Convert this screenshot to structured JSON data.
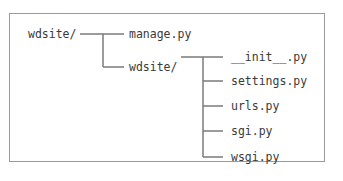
{
  "diagram": {
    "type": "directory-tree",
    "root": "wdsite/",
    "level1": [
      "manage.py",
      "wdsite/"
    ],
    "level2": [
      "__init__.py",
      "settings.py",
      "urls.py",
      "sgi.py",
      "wsgi.py"
    ]
  },
  "colors": {
    "line": "#7a7a7a",
    "text": "#3a3a3a",
    "border": "#9a9a9a"
  }
}
